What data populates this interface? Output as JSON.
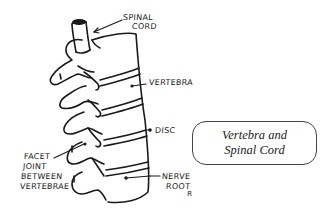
{
  "diagram": {
    "title_box": {
      "line1": "Vertebra and",
      "line2": "Spinal Cord"
    },
    "labels": {
      "spinal_cord_1": "SPINAL",
      "spinal_cord_2": "CORD",
      "vertebra": "VERTEBRA",
      "disc": "DISC",
      "facet_1": "FACET",
      "facet_2": "JOINT",
      "facet_3": "BETWEEN",
      "facet_4": "VERTEBRAE",
      "nerve_1": "NERVE",
      "nerve_2": "ROOT",
      "side_marker": "R"
    },
    "colors": {
      "ink": "#1a1a1a",
      "background": "#ffffff",
      "box_border": "#444444"
    }
  }
}
